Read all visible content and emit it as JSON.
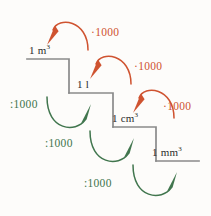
{
  "figure": {
    "kind": "metric-volume-conversion-staircase",
    "background_color": "#fdfcfa",
    "step_line_color": "#8a8a8a",
    "multiply_color": "#cf5330",
    "divide_color": "#41764e",
    "text_color": "#2b2b2b"
  },
  "steps": [
    {
      "id": "step-m3",
      "label": "1 m",
      "exponent": "3",
      "full_text": "1 m³"
    },
    {
      "id": "step-l",
      "label": "1 l",
      "exponent": "",
      "full_text": "1 l"
    },
    {
      "id": "step-cm3",
      "label": "1 cm",
      "exponent": "3",
      "full_text": "1 cm³"
    },
    {
      "id": "step-mm3",
      "label": "1 mm",
      "exponent": "3",
      "full_text": "1 mm³"
    }
  ],
  "multiply_arrows": [
    {
      "id": "mult-1",
      "label": "·1000",
      "from": "1 l",
      "to": "1 m³"
    },
    {
      "id": "mult-2",
      "label": "·1000",
      "from": "1 cm³",
      "to": "1 l"
    },
    {
      "id": "mult-3",
      "label": "·1000",
      "from": "1 mm³",
      "to": "1 cm³"
    }
  ],
  "divide_arrows": [
    {
      "id": "div-1",
      "label": ":1000",
      "from": "1 m³",
      "to": "1 l"
    },
    {
      "id": "div-2",
      "label": ":1000",
      "from": "1 l",
      "to": "1 cm³"
    },
    {
      "id": "div-3",
      "label": ":1000",
      "from": "1 cm³",
      "to": "1 mm³"
    }
  ]
}
